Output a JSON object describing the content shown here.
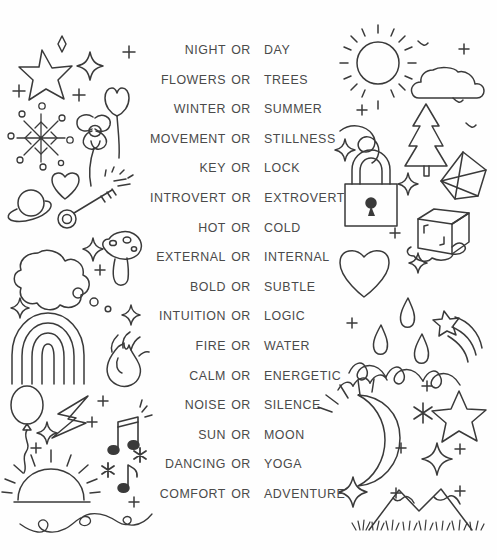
{
  "page": {
    "background_color": "#fefefe",
    "ink_color": "#3a3a3a",
    "text_color": "#4a4a4a"
  },
  "list": {
    "separator_label": "OR",
    "rows": [
      {
        "left": "NIGHT",
        "or": "OR",
        "right": "DAY"
      },
      {
        "left": "FLOWERS",
        "or": "OR",
        "right": "TREES"
      },
      {
        "left": "WINTER",
        "or": "OR",
        "right": "SUMMER"
      },
      {
        "left": "MOVEMENT",
        "or": "OR",
        "right": "STILLNESS"
      },
      {
        "left": "KEY",
        "or": "OR",
        "right": "LOCK"
      },
      {
        "left": "INTROVERT",
        "or": "OR",
        "right": "EXTROVERT"
      },
      {
        "left": "HOT",
        "or": "OR",
        "right": "COLD"
      },
      {
        "left": "EXTERNAL",
        "or": "OR",
        "right": "INTERNAL"
      },
      {
        "left": "BOLD",
        "or": "OR",
        "right": "SUBTLE"
      },
      {
        "left": "INTUITION",
        "or": "OR",
        "right": "LOGIC"
      },
      {
        "left": "FIRE",
        "or": "OR",
        "right": "WATER"
      },
      {
        "left": "CALM",
        "or": "OR",
        "right": "ENERGETIC"
      },
      {
        "left": "NOISE",
        "or": "OR",
        "right": "SILENCE"
      },
      {
        "left": "SUN",
        "or": "OR",
        "right": "MOON"
      },
      {
        "left": "DANCING",
        "or": "OR",
        "right": "YOGA"
      },
      {
        "left": "COMFORT",
        "or": "OR",
        "right": "ADVENTURE"
      }
    ]
  },
  "doodles": {
    "left_column": [
      "star-icon",
      "sparkle-icon",
      "sparkle-icon",
      "plus-icon",
      "plus-icon",
      "snowflake-icon",
      "tulip-icon",
      "flower-icon",
      "heart-icon",
      "saturn-planet-icon",
      "key-icon",
      "cloud-icon",
      "mushroom-icon",
      "rainbow-icon",
      "fire-icon",
      "balloon-icon",
      "lightning-bolt-icon",
      "music-notes-icon",
      "music-note-icon",
      "asterisk-icon",
      "sunrise-icon",
      "flourish-divider-icon",
      "bubbles-icon"
    ],
    "right_column": [
      "sun-icon",
      "cloud-icon",
      "bird-icon",
      "bird-icon",
      "plus-icon",
      "wind-swirl-icon",
      "pine-tree-icon",
      "padlock-icon",
      "crystal-gem-icon",
      "ice-cube-icon",
      "heart-icon",
      "water-drop-icon",
      "water-drop-icon",
      "shooting-star-icon",
      "waves-icon",
      "crescent-moon-icon",
      "star-icon",
      "sparkle-icon",
      "asterisk-icon",
      "mountains-icon"
    ]
  }
}
